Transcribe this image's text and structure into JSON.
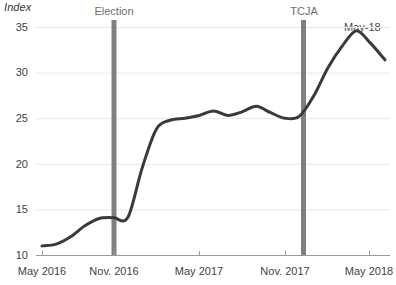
{
  "chart_data": {
    "type": "line",
    "title": "",
    "ylabel": "Index",
    "xlabel": "",
    "ylim": [
      10,
      35
    ],
    "xlim": [
      "May 2016",
      "May 2018"
    ],
    "grid": true,
    "legend_position": "none",
    "y_ticks": [
      10,
      15,
      20,
      25,
      30,
      35
    ],
    "x_ticks": [
      "May 2016",
      "Nov. 2016",
      "May 2017",
      "Nov. 2017",
      "May 2018"
    ],
    "annotations": [
      {
        "name": "Election",
        "x": "Nov. 2016",
        "type": "vertical-band"
      },
      {
        "name": "TCJA",
        "x": "Dec. 2017",
        "type": "vertical-band"
      },
      {
        "name": "May-18",
        "x": "May 2018",
        "type": "series-end-label"
      }
    ],
    "series": [
      {
        "name": "Index",
        "color": "#3a3a3a",
        "x": [
          "May 2016",
          "Jun. 2016",
          "Jul. 2016",
          "Aug. 2016",
          "Sep. 2016",
          "Oct. 2016",
          "Nov. 2016",
          "Dec. 2016",
          "Jan. 2017",
          "Feb. 2017",
          "Mar. 2017",
          "Apr. 2017",
          "May 2017",
          "Jun. 2017",
          "Jul. 2017",
          "Aug. 2017",
          "Sep. 2017",
          "Oct. 2017",
          "Nov. 2017",
          "Dec. 2017",
          "Jan. 2018",
          "Feb. 2018",
          "Mar. 2018",
          "Apr. 2018",
          "May 2018"
        ],
        "values": [
          11.0,
          11.2,
          12.0,
          13.2,
          14.0,
          14.1,
          14.1,
          19.5,
          23.8,
          24.8,
          25.0,
          25.3,
          25.8,
          25.3,
          25.7,
          26.3,
          25.6,
          25.0,
          25.2,
          27.4,
          30.5,
          32.9,
          34.6,
          33.2,
          31.4
        ]
      }
    ]
  },
  "axis": {
    "y_title": "Index",
    "y_labels": [
      "35",
      "30",
      "25",
      "20",
      "15",
      "10"
    ],
    "x_labels": [
      "May 2016",
      "Nov. 2016",
      "May 2017",
      "Nov. 2017",
      "May 2018"
    ]
  },
  "events": {
    "election_label": "Election",
    "tcja_label": "TCJA",
    "end_label": "May-18"
  },
  "colors": {
    "line": "#3a3a3a",
    "event_band": "#808080",
    "grid": "#e6e6e6",
    "axis": "#9a9a9a",
    "text": "#3f3f3f"
  }
}
